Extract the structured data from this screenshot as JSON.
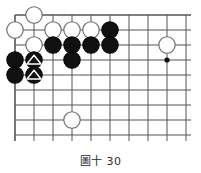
{
  "figure": {
    "caption": "圖十 30",
    "type": "go-board-diagram"
  },
  "board": {
    "colors": {
      "background": "#ffffff",
      "grid_line": "#555555",
      "edge_line": "#444444",
      "black_stone_fill": "#111111",
      "black_stone_stroke": "#000000",
      "white_stone_fill": "#ffffff",
      "white_stone_stroke": "#666666",
      "marker": "#ffffff",
      "star_point": "#111111"
    },
    "geometry": {
      "origin_x": 15,
      "origin_y": 15,
      "col_spacing": 19,
      "row_spacing": 15,
      "cols": 10,
      "rows": 9,
      "stone_radius": 8.2,
      "line_width": 1.0,
      "edge_line_width": 1.6
    },
    "star_points": [
      {
        "col": 8,
        "row": 3
      }
    ],
    "stones": [
      {
        "col": 1,
        "row": 0,
        "color": "white",
        "mark": "none",
        "label": "white-stone"
      },
      {
        "col": 0,
        "row": 1,
        "color": "white",
        "mark": "none",
        "label": "white-stone"
      },
      {
        "col": 2,
        "row": 1,
        "color": "white",
        "mark": "none",
        "label": "white-stone"
      },
      {
        "col": 3,
        "row": 1,
        "color": "white",
        "mark": "none",
        "label": "white-stone"
      },
      {
        "col": 4,
        "row": 1,
        "color": "white",
        "mark": "none",
        "label": "white-stone"
      },
      {
        "col": 5,
        "row": 1,
        "color": "black",
        "mark": "none",
        "label": "black-stone"
      },
      {
        "col": 1,
        "row": 2,
        "color": "white",
        "mark": "none",
        "label": "white-stone"
      },
      {
        "col": 2,
        "row": 2,
        "color": "black",
        "mark": "none",
        "label": "black-stone"
      },
      {
        "col": 3,
        "row": 2,
        "color": "black",
        "mark": "none",
        "label": "black-stone"
      },
      {
        "col": 4,
        "row": 2,
        "color": "black",
        "mark": "none",
        "label": "black-stone"
      },
      {
        "col": 5,
        "row": 2,
        "color": "black",
        "mark": "none",
        "label": "black-stone"
      },
      {
        "col": 8,
        "row": 2,
        "color": "white",
        "mark": "none",
        "label": "white-stone"
      },
      {
        "col": 0,
        "row": 3,
        "color": "black",
        "mark": "none",
        "label": "black-stone"
      },
      {
        "col": 1,
        "row": 3,
        "color": "black",
        "mark": "triangle",
        "label": "black-stone-triangle"
      },
      {
        "col": 3,
        "row": 3,
        "color": "black",
        "mark": "none",
        "label": "black-stone"
      },
      {
        "col": 0,
        "row": 4,
        "color": "black",
        "mark": "none",
        "label": "black-stone"
      },
      {
        "col": 1,
        "row": 4,
        "color": "black",
        "mark": "triangle",
        "label": "black-stone-triangle"
      },
      {
        "col": 3,
        "row": 7,
        "color": "white",
        "mark": "none",
        "label": "white-stone"
      }
    ]
  }
}
